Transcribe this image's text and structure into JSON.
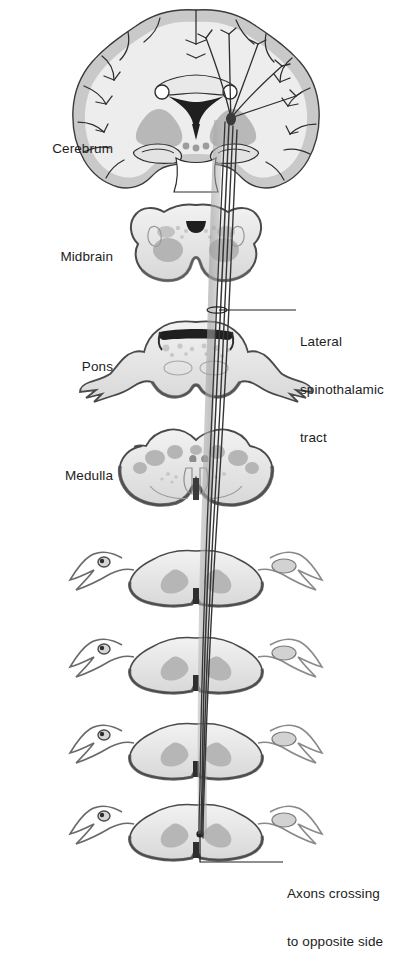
{
  "figure": {
    "type": "anatomical-diagram",
    "background_color": "#ffffff",
    "ink_color": "#1d1d1d"
  },
  "labels": {
    "cerebrum": "Cerebrum",
    "midbrain": "Midbrain",
    "pons": "Pons",
    "medulla": "Medulla",
    "lateral_spinothalamic_tract": {
      "line1": "Lateral",
      "line2": "spinothalamic",
      "line3": "tract"
    },
    "axons_crossing": {
      "line1": "Axons crossing",
      "line2": "to opposite side"
    }
  },
  "sections": [
    {
      "name": "cerebrum",
      "shape": "coronal-brain-section",
      "center_y": 100
    },
    {
      "name": "midbrain",
      "shape": "butterfly-section",
      "center_y": 247
    },
    {
      "name": "pons",
      "shape": "pons-section",
      "center_y": 362
    },
    {
      "name": "medulla",
      "shape": "heart-section",
      "center_y": 472
    },
    {
      "name": "spinal-cord-1",
      "shape": "spinal-cord-section",
      "center_y": 575
    },
    {
      "name": "spinal-cord-2",
      "shape": "spinal-cord-section",
      "center_y": 662
    },
    {
      "name": "spinal-cord-3",
      "shape": "spinal-cord-section",
      "center_y": 748
    },
    {
      "name": "spinal-cord-4",
      "shape": "spinal-cord-section",
      "center_y": 828
    }
  ],
  "colors": {
    "outline": "#2a2a2a",
    "cortex_gray": "#cfcfcf",
    "white_matter": "#ededed",
    "deep_gray": "#bdbdbd",
    "tract_band": "#b9b9b9",
    "tract_line": "#3a3a3a",
    "leader_line": "#2a2a2a"
  }
}
